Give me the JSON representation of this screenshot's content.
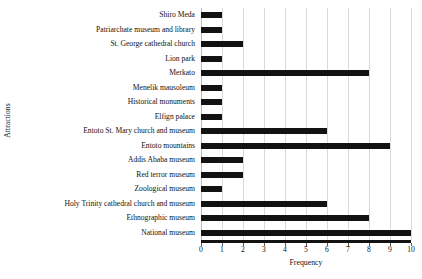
{
  "chart_data": {
    "type": "bar",
    "orientation": "horizontal",
    "title": "",
    "xlabel": "Frequency",
    "ylabel": "Attractions",
    "xlim": [
      0,
      10
    ],
    "xticks": [
      0,
      1,
      2,
      3,
      4,
      5,
      6,
      7,
      8,
      9,
      10
    ],
    "xtick_labels": [
      "0",
      "1",
      "2",
      "3",
      "4",
      "5",
      "6",
      "7",
      "8",
      "9",
      "10"
    ],
    "grid": "vertical",
    "legend": "none",
    "bar_color": "#121212",
    "gridline_color": "#d9d9d9",
    "categories": [
      "Shiro Meda",
      "Patriarchate museum and library",
      "St. George cathedral church",
      "Lion park",
      "Merkato",
      "Menelik mausoleum",
      "Historical monuments",
      "Elfign palace",
      "Entoto St. Mary church and museum",
      "Entoto mountains",
      "Addis Ababa museum",
      "Red terror museum",
      "Zoological museum",
      "Holy Trinity cathedral church and museum",
      "Ethnographic museum",
      "National museum"
    ],
    "values": [
      1,
      1,
      2,
      1,
      8,
      1,
      1,
      1,
      6,
      9,
      2,
      2,
      1,
      6,
      8,
      10
    ]
  }
}
